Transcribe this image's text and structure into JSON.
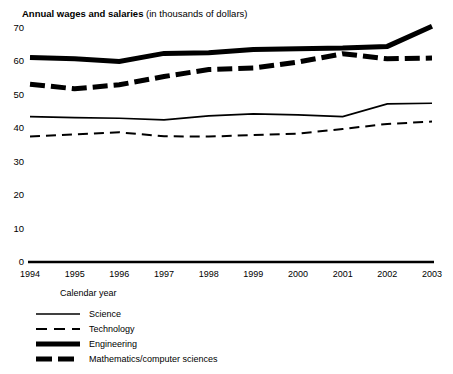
{
  "chart_data": {
    "type": "line",
    "title": "Annual wages and salaries",
    "title_note": "(in thousands of dollars)",
    "xlabel": "Calendar year",
    "ylabel": "",
    "categories": [
      "1994",
      "1995",
      "1996",
      "1997",
      "1998",
      "1999",
      "2000",
      "2001",
      "2002",
      "2003"
    ],
    "x": [
      1994,
      1995,
      1996,
      1997,
      1998,
      1999,
      2000,
      2001,
      2002,
      2003
    ],
    "xlim": [
      1994,
      2003
    ],
    "ylim": [
      0,
      70
    ],
    "yticks": [
      "0",
      "10",
      "20",
      "30",
      "40",
      "50",
      "60",
      "70"
    ],
    "ytick_values": [
      0,
      10,
      20,
      30,
      40,
      50,
      60,
      70
    ],
    "grid": false,
    "legend_position": "below-left",
    "series": [
      {
        "name": "Science",
        "style": "thin-solid",
        "values": [
          43.5,
          43.2,
          43.0,
          42.5,
          43.7,
          44.3,
          44.0,
          43.5,
          47.3,
          47.5
        ]
      },
      {
        "name": "Technology",
        "style": "thin-dashed",
        "values": [
          37.5,
          38.2,
          38.8,
          37.6,
          37.5,
          38.0,
          38.4,
          39.8,
          41.3,
          42.0
        ]
      },
      {
        "name": "Engineering",
        "style": "thick-solid",
        "values": [
          61.2,
          60.8,
          60.0,
          62.4,
          62.6,
          63.6,
          63.8,
          64.0,
          64.5,
          70.5
        ]
      },
      {
        "name": "Mathematics/computer sciences",
        "style": "thick-dashed",
        "values": [
          53.2,
          51.8,
          53.0,
          55.5,
          57.6,
          58.0,
          59.8,
          62.3,
          60.8,
          61.0
        ]
      }
    ]
  },
  "legend": {
    "items": [
      {
        "label": "Science"
      },
      {
        "label": "Technology"
      },
      {
        "label": "Engineering"
      },
      {
        "label": "Mathematics/computer sciences"
      }
    ]
  }
}
